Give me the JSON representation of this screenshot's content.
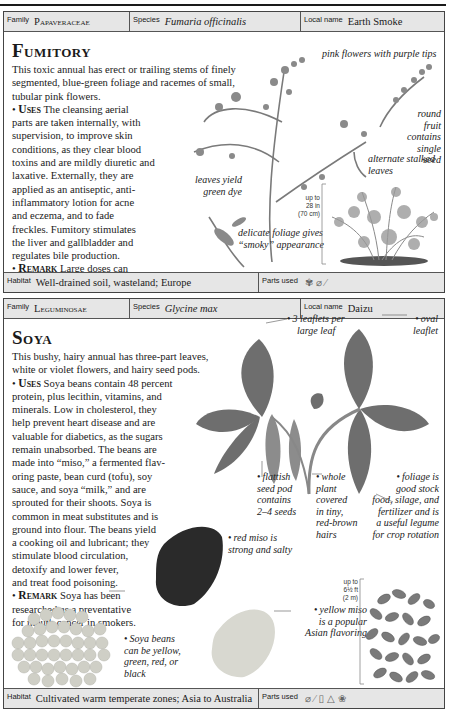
{
  "running_header": "A–Z OF MEDICINAL PLANTS",
  "entries": [
    {
      "family_label": "Family",
      "family": "Papaveraceae",
      "species_label": "Species",
      "species": "Fumaria officinalis",
      "local_name_label": "Local name",
      "local_name": "Earth Smoke",
      "title": "Fumitory",
      "intro": "This toxic annual has erect or trailing stems of finely segmented, blue-green foliage and racemes of small, tubular pink flowers.",
      "uses_label": "Uses",
      "uses_lines": [
        "The cleansing aerial",
        "parts are taken internally, with",
        "supervision, to improve skin",
        "conditions, as they clear blood",
        "toxins and are mildly diuretic and",
        "laxative. Externally, they are",
        "applied as an antiseptic, anti-",
        "inflammatory lotion for acne",
        "and eczema, and to fade",
        "freckles. Fumitory stimulates",
        "the liver and gallbladder and",
        "regulates bile production."
      ],
      "remark_label": "Remark",
      "remark_lines": [
        "Large doses can",
        "cause diarrhea and respiratory failure."
      ],
      "annotations": [
        {
          "text": "pink flowers with purple tips"
        },
        {
          "text": "round fruit contains single seed"
        },
        {
          "text": "alternate stalked leaves"
        },
        {
          "text": "leaves yield green dye"
        },
        {
          "text": "delicate foliage gives “smoky” appearance"
        }
      ],
      "scale": [
        "up to",
        "28 in",
        "(70 cm)"
      ],
      "habitat_label": "Habitat",
      "habitat": "Well-drained soil, wasteland; Europe",
      "parts_used_label": "Parts used",
      "parts_used_icons": [
        "aerial-parts-icon",
        "leaf-icon",
        "stem-icon"
      ]
    },
    {
      "family_label": "Family",
      "family": "Leguminosae",
      "species_label": "Species",
      "species": "Glycine max",
      "local_name_label": "Local name",
      "local_name": "Daizu",
      "title": "Soya",
      "intro_lines": [
        "This bushy, hairy annual has three-part leaves,",
        "white or violet flowers, and hairy seed pods."
      ],
      "uses_label": "Uses",
      "uses_lines": [
        "Soya beans contain 48 percent",
        "protein, plus lecithin, vitamins, and",
        "minerals. Low in cholesterol, they",
        "help prevent heart disease and are",
        "valuable for diabetics, as the sugars",
        "remain unabsorbed. The beans are",
        "made into “miso,” a fermented flav-",
        "oring paste, bean curd (tofu), soy",
        "sauce, and soya “milk,” and are",
        "sprouted for their shoots. Soya is",
        "common in meat substitutes and is",
        "ground into flour. The beans yield",
        "a cooking oil and lubricant; they",
        "stimulate blood circulation,",
        "detoxify and lower fever,",
        "and treat food poisoning."
      ],
      "remark_label": "Remark",
      "remark_lines": [
        "Soya has been",
        "researched as a preventative",
        "for mouth cancer in smokers."
      ],
      "annotations": [
        {
          "lines": [
            "3 leaflets per",
            "large leaf"
          ]
        },
        {
          "lines": [
            "oval",
            "leaflet"
          ]
        },
        {
          "lines": [
            "flattish",
            "seed pod",
            "contains",
            "2–4 seeds"
          ]
        },
        {
          "lines": [
            "whole",
            "plant",
            "covered",
            "in tiny,",
            "red-brown",
            "hairs"
          ]
        },
        {
          "lines": [
            "foliage is",
            "good stock",
            "food, silage, and",
            "fertilizer and is",
            "a useful legume",
            "for crop rotation"
          ]
        },
        {
          "lines": [
            "red miso is",
            "strong and salty"
          ]
        },
        {
          "lines": [
            "yellow miso",
            "is a popular",
            "Asian flavoring"
          ]
        },
        {
          "lines": [
            "Soya beans",
            "can be yellow,",
            "green, red, or",
            "black"
          ]
        }
      ],
      "scale": [
        "up to",
        "6½ ft",
        "(2 m)"
      ],
      "habitat_label": "Habitat",
      "habitat": "Cultivated warm temperate zones; Asia to Australia",
      "parts_used_label": "Parts used",
      "parts_used_icons": [
        "leaf-icon",
        "stem-icon",
        "oil-icon",
        "seed-icon",
        "bean-icon"
      ]
    }
  ],
  "colors": {
    "bar_bg": "#e6e6e6",
    "border": "#444444",
    "leaf": "#6e6e6e",
    "text": "#1a1a1a"
  }
}
